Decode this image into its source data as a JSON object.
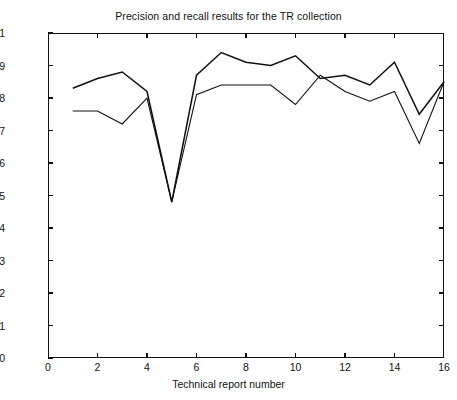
{
  "chart_data": {
    "type": "line",
    "title": "Precision and recall results for the TR collection",
    "xlabel": "Technical report number",
    "ylabel": "Percentage",
    "xlim": [
      0,
      16
    ],
    "ylim": [
      0,
      1
    ],
    "grid": false,
    "legend": "none",
    "x": [
      1,
      2,
      3,
      4,
      5,
      6,
      7,
      8,
      9,
      10,
      11,
      12,
      13,
      14,
      15,
      16
    ],
    "xticks": [
      "0",
      "2",
      "4",
      "6",
      "8",
      "10",
      "12",
      "14",
      "16"
    ],
    "xtick_values": [
      0,
      2,
      4,
      6,
      8,
      10,
      12,
      14,
      16
    ],
    "yticks": [
      "0",
      "0.1",
      "0.2",
      "0.3",
      "0.4",
      "0.5",
      "0.6",
      "0.7",
      "0.8",
      "0.9",
      "1"
    ],
    "ytick_values": [
      0,
      0.1,
      0.2,
      0.3,
      0.4,
      0.5,
      0.6,
      0.7,
      0.8,
      0.9,
      1
    ],
    "series": [
      {
        "name": "Precision",
        "color": "#111111",
        "values": [
          0.83,
          0.86,
          0.88,
          0.82,
          0.48,
          0.87,
          0.94,
          0.91,
          0.9,
          0.93,
          0.86,
          0.87,
          0.84,
          0.91,
          0.75,
          0.85
        ]
      },
      {
        "name": "Recall",
        "color": "#111111",
        "values": [
          0.76,
          0.76,
          0.72,
          0.8,
          0.48,
          0.81,
          0.84,
          0.84,
          0.84,
          0.78,
          0.87,
          0.82,
          0.79,
          0.82,
          0.66,
          0.85
        ]
      }
    ]
  },
  "axes": {
    "title": "Precision and recall results for the TR collection",
    "xlabel": "Technical report number",
    "ylabel": "Percentage"
  }
}
